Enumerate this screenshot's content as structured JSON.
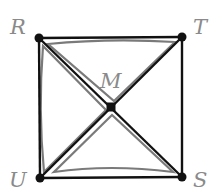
{
  "diagram": {
    "type": "geometry",
    "shape": "square with diagonals",
    "points": {
      "R": {
        "label": "R",
        "x": 39,
        "y": 38
      },
      "T": {
        "label": "T",
        "x": 182,
        "y": 37
      },
      "S": {
        "label": "S",
        "x": 182,
        "y": 177
      },
      "U": {
        "label": "U",
        "x": 40,
        "y": 178
      },
      "M": {
        "label": "M",
        "x": 111,
        "y": 107
      }
    },
    "segments": [
      "RT",
      "TS",
      "SU",
      "UR",
      "RS",
      "TU"
    ],
    "highlighted_triangles": [
      "RTM",
      "RUM",
      "USM"
    ],
    "colors": {
      "line": "#111111",
      "highlight": "#7a7a7a",
      "label": "#8a8a8a"
    }
  }
}
